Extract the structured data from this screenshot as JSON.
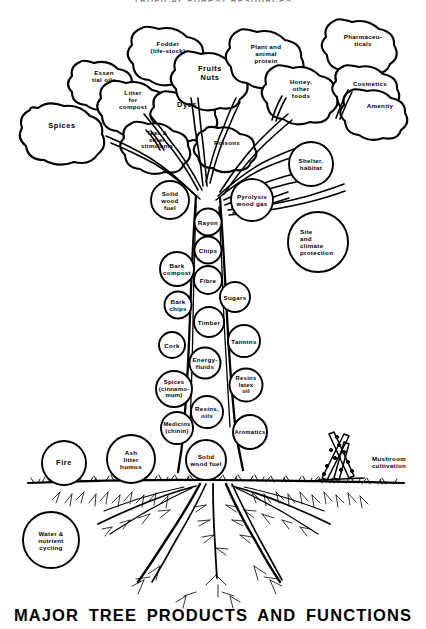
{
  "titles": {
    "top": "TROPICAL FOREST RESOURCES",
    "bottom": "MAJOR TREE PRODUCTS AND FUNCTIONS"
  },
  "diagram": {
    "type": "annotated-tree-diagram",
    "subject": "tree",
    "zones": [
      "crown",
      "trunk",
      "ground-level",
      "roots"
    ]
  },
  "crown_labels": [
    {
      "id": "spices",
      "text": "Spices",
      "x": 62,
      "y": 126,
      "size": "big"
    },
    {
      "id": "essential-oils",
      "text": "Essen\ntial oils",
      "x": 104,
      "y": 76,
      "size": "sm"
    },
    {
      "id": "litter-compost",
      "text": "Litter\nfor\ncompost",
      "x": 133,
      "y": 99,
      "size": "sm"
    },
    {
      "id": "fodder",
      "text": "Fodder\n(life-stock)",
      "x": 168,
      "y": 47,
      "size": "sm"
    },
    {
      "id": "dyes",
      "text": "Dyes",
      "x": 187,
      "y": 105,
      "size": "big"
    },
    {
      "id": "teas",
      "text": "Teas &\nother\nstimulants",
      "x": 157,
      "y": 140,
      "size": "tiny"
    },
    {
      "id": "fruits-nuts",
      "text": "Fruits\nNuts",
      "x": 210,
      "y": 74,
      "size": "big"
    },
    {
      "id": "poisons",
      "text": "Poisons",
      "x": 227,
      "y": 142,
      "size": "sm"
    },
    {
      "id": "plant-animal-protein",
      "text": "Plant and\nanimal\nprotein",
      "x": 266,
      "y": 53,
      "size": "sm"
    },
    {
      "id": "honey-other-foods",
      "text": "Honey,\nother\nfoods",
      "x": 301,
      "y": 88,
      "size": "sm"
    },
    {
      "id": "pharmaceuticals",
      "text": "Pharmaceu-\nticals",
      "x": 363,
      "y": 40,
      "size": "sm"
    },
    {
      "id": "cosmetics",
      "text": "Cosmetics",
      "x": 370,
      "y": 83,
      "size": "sm"
    },
    {
      "id": "amenity",
      "text": "Amenity",
      "x": 380,
      "y": 105,
      "size": "sm"
    },
    {
      "id": "shelter-habitat",
      "text": "Shelter,\nhabitat",
      "x": 311,
      "y": 164,
      "size": "sm"
    }
  ],
  "trunk_labels": [
    {
      "id": "solid-wood-fuel-top",
      "text": "Solid\nwood\nfuel",
      "x": 170,
      "y": 200,
      "size": "sm"
    },
    {
      "id": "pyrolysis-wood-gas",
      "text": "Pyrolysis\nwood gas",
      "x": 252,
      "y": 200,
      "size": "sm"
    },
    {
      "id": "rayon",
      "text": "Rayon",
      "x": 208,
      "y": 222,
      "size": "sm"
    },
    {
      "id": "chips",
      "text": "Chips",
      "x": 208,
      "y": 250,
      "size": "sm"
    },
    {
      "id": "bark-compost",
      "text": "Bark\ncompost",
      "x": 177,
      "y": 269,
      "size": "sm"
    },
    {
      "id": "fibre",
      "text": "Fibre",
      "x": 208,
      "y": 280,
      "size": "sm"
    },
    {
      "id": "sugars",
      "text": "Sugars",
      "x": 235,
      "y": 297,
      "size": "sm"
    },
    {
      "id": "bark-chips",
      "text": "Bark\nchips",
      "x": 178,
      "y": 305,
      "size": "sm"
    },
    {
      "id": "timber",
      "text": "Timber",
      "x": 209,
      "y": 322,
      "size": "sm"
    },
    {
      "id": "tannins",
      "text": "Tannins",
      "x": 244,
      "y": 341,
      "size": "sm"
    },
    {
      "id": "cork",
      "text": "Cork",
      "x": 172,
      "y": 345,
      "size": "sm"
    },
    {
      "id": "energy-fluids",
      "text": "Energy-\nfluids",
      "x": 205,
      "y": 363,
      "size": "sm"
    },
    {
      "id": "spices-cinnamon",
      "text": "Spices\n(cinnamo-\nmum)",
      "x": 174,
      "y": 389,
      "size": "tiny"
    },
    {
      "id": "resins-latex-oil",
      "text": "Resins\nlatex\noil",
      "x": 246,
      "y": 385,
      "size": "tiny"
    },
    {
      "id": "resins-oils",
      "text": "Resins,\noils",
      "x": 207,
      "y": 412,
      "size": "sm"
    },
    {
      "id": "medicins-chinin",
      "text": "Medicins\n(chinin)",
      "x": 177,
      "y": 428,
      "size": "tiny"
    },
    {
      "id": "aromatics",
      "text": "Aromatics",
      "x": 250,
      "y": 432,
      "size": "tiny"
    },
    {
      "id": "solid-wood-fuel-bottom",
      "text": "Solid\nwood fuel",
      "x": 206,
      "y": 460,
      "size": "sm"
    }
  ],
  "ground_labels": [
    {
      "id": "fire",
      "text": "Fire",
      "x": 64,
      "y": 463,
      "size": "big"
    },
    {
      "id": "ash-litter-humus",
      "text": "Ash\nlitter\nhumus",
      "x": 131,
      "y": 459,
      "size": "sm"
    },
    {
      "id": "water-nutrient-cycling",
      "text": "Water &\nnutrient\ncycling",
      "x": 51,
      "y": 540,
      "size": "sm"
    },
    {
      "id": "site-climate-protection",
      "text": "Site\nand\nclimate\nprotection",
      "x": 290,
      "y": 242,
      "size": "sm",
      "align": "left"
    },
    {
      "id": "mushroom-cultivation",
      "text": "Mushroom\ncultivation",
      "x": 389,
      "y": 462,
      "size": "sm"
    }
  ],
  "colors": {
    "ink": "#000000",
    "paper": "#ffffff"
  }
}
